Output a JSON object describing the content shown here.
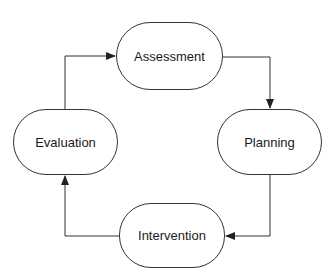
{
  "diagram": {
    "type": "cycle",
    "nodes": [
      {
        "id": "assessment",
        "label": "Assessment"
      },
      {
        "id": "planning",
        "label": "Planning"
      },
      {
        "id": "intervention",
        "label": "Intervention"
      },
      {
        "id": "evaluation",
        "label": "Evaluation"
      }
    ],
    "edges": [
      {
        "from": "assessment",
        "to": "planning"
      },
      {
        "from": "planning",
        "to": "intervention"
      },
      {
        "from": "intervention",
        "to": "evaluation"
      },
      {
        "from": "evaluation",
        "to": "assessment"
      }
    ],
    "colors": {
      "stroke": "#333333",
      "text": "#1a1a1a",
      "background": "#ffffff"
    }
  }
}
